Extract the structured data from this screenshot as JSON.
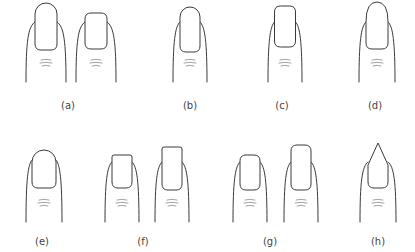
{
  "figure": {
    "line_color": "#3a3a3a",
    "crease_color": "#8a8a8a",
    "background": "#ffffff"
  },
  "panels": [
    {
      "id": "a",
      "label": "(a)",
      "label_x": 68,
      "label_y": 100,
      "fingers": [
        {
          "cx": 46,
          "shape": "long-oval",
          "nail_top": 3,
          "nail_bottom": 50,
          "nail_w": 22,
          "finger_top": 22,
          "finger_bottom": 82,
          "finger_w": 40
        },
        {
          "cx": 96,
          "shape": "short-rounded-square",
          "nail_top": 13,
          "nail_bottom": 49,
          "nail_w": 22,
          "finger_top": 22,
          "finger_bottom": 82,
          "finger_w": 40
        }
      ]
    },
    {
      "id": "b",
      "label": "(b)",
      "label_x": 190,
      "label_y": 100,
      "fingers": [
        {
          "cx": 190,
          "shape": "oval",
          "nail_top": 7,
          "nail_bottom": 52,
          "nail_w": 20,
          "finger_top": 22,
          "finger_bottom": 82,
          "finger_w": 34
        }
      ]
    },
    {
      "id": "c",
      "label": "(c)",
      "label_x": 282,
      "label_y": 100,
      "fingers": [
        {
          "cx": 285,
          "shape": "squoval-long",
          "nail_top": 6,
          "nail_bottom": 47,
          "nail_w": 21,
          "finger_top": 22,
          "finger_bottom": 82,
          "finger_w": 34
        }
      ]
    },
    {
      "id": "d",
      "label": "(d)",
      "label_x": 375,
      "label_y": 100,
      "fingers": [
        {
          "cx": 377,
          "shape": "almond",
          "nail_top": 2,
          "nail_bottom": 49,
          "nail_w": 22,
          "finger_top": 22,
          "finger_bottom": 82,
          "finger_w": 36
        }
      ]
    },
    {
      "id": "e",
      "label": "(e)",
      "label_x": 42,
      "label_y": 236,
      "fingers": [
        {
          "cx": 44,
          "shape": "round",
          "nail_top": 150,
          "nail_bottom": 188,
          "nail_w": 24,
          "finger_top": 160,
          "finger_bottom": 222,
          "finger_w": 36
        }
      ]
    },
    {
      "id": "f",
      "label": "(f)",
      "label_x": 143,
      "label_y": 236,
      "fingers": [
        {
          "cx": 122,
          "shape": "square",
          "nail_top": 155,
          "nail_bottom": 188,
          "nail_w": 20,
          "finger_top": 162,
          "finger_bottom": 222,
          "finger_w": 34
        },
        {
          "cx": 172,
          "shape": "square-long",
          "nail_top": 147,
          "nail_bottom": 190,
          "nail_w": 20,
          "finger_top": 162,
          "finger_bottom": 222,
          "finger_w": 34
        }
      ]
    },
    {
      "id": "g",
      "label": "(g)",
      "label_x": 270,
      "label_y": 236,
      "fingers": [
        {
          "cx": 250,
          "shape": "squoval",
          "nail_top": 155,
          "nail_bottom": 190,
          "nail_w": 20,
          "finger_top": 162,
          "finger_bottom": 222,
          "finger_w": 34
        },
        {
          "cx": 301,
          "shape": "squoval-long",
          "nail_top": 145,
          "nail_bottom": 190,
          "nail_w": 20,
          "finger_top": 162,
          "finger_bottom": 222,
          "finger_w": 34
        }
      ]
    },
    {
      "id": "h",
      "label": "(h)",
      "label_x": 378,
      "label_y": 236,
      "fingers": [
        {
          "cx": 378,
          "shape": "pointed",
          "nail_top": 143,
          "nail_bottom": 188,
          "nail_w": 20,
          "finger_top": 162,
          "finger_bottom": 222,
          "finger_w": 36
        }
      ]
    }
  ]
}
